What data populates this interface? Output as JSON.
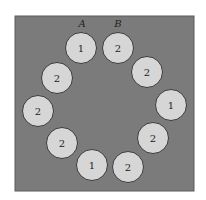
{
  "diagram": {
    "colors": {
      "background": "#ffffff",
      "board": "#7b7b7b",
      "board_border": "#5a5a5a",
      "circle_fill": "#d6d6d6",
      "circle_stroke": "#3a3a3a",
      "text": "#222222"
    },
    "markers": [
      {
        "label": "A",
        "x": 82,
        "y": 27
      },
      {
        "label": "B",
        "x": 118,
        "y": 27
      }
    ],
    "circles": [
      {
        "value": "1",
        "cx": 81,
        "cy": 48
      },
      {
        "value": "2",
        "cx": 118,
        "cy": 48
      },
      {
        "value": "2",
        "cx": 147,
        "cy": 72
      },
      {
        "value": "1",
        "cx": 171,
        "cy": 105
      },
      {
        "value": "2",
        "cx": 153,
        "cy": 138
      },
      {
        "value": "2",
        "cx": 128,
        "cy": 167
      },
      {
        "value": "1",
        "cx": 92,
        "cy": 165
      },
      {
        "value": "2",
        "cx": 62,
        "cy": 143
      },
      {
        "value": "2",
        "cx": 38,
        "cy": 111
      },
      {
        "value": "2",
        "cx": 57,
        "cy": 78
      }
    ]
  }
}
